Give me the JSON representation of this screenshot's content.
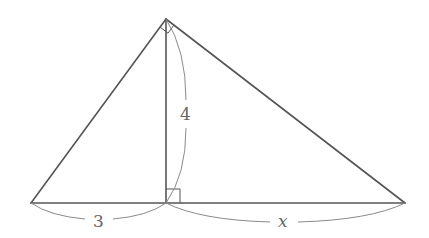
{
  "diagram": {
    "type": "right-triangle-with-altitude",
    "points": {
      "A": {
        "x": 31,
        "y": 203
      },
      "B": {
        "x": 166,
        "y": 19
      },
      "C": {
        "x": 405,
        "y": 203
      },
      "D": {
        "x": 166,
        "y": 203
      }
    },
    "labels": {
      "left_segment": "3",
      "altitude": "4",
      "right_segment": "x"
    },
    "right_angles": [
      "at apex B",
      "at foot D"
    ],
    "colors": {
      "edge": "#555555",
      "brace": "#8a8a8a",
      "label": "#666666"
    }
  }
}
